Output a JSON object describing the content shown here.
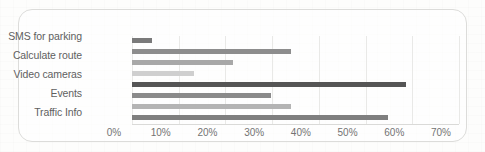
{
  "chart_data": {
    "type": "bar",
    "orientation": "horizontal",
    "title": "",
    "xlabel": "",
    "ylabel": "",
    "grid": true,
    "legend": "none",
    "xlim": [
      0,
      70
    ],
    "categories": [
      "SMS for parking",
      "Calculate route",
      "Video cameras",
      "Events",
      "Traffic Info"
    ],
    "tick_labels": [
      "0%",
      "10%",
      "20%",
      "30%",
      "40%",
      "50%",
      "60%",
      "70%"
    ],
    "tick_values": [
      0,
      10,
      20,
      30,
      40,
      50,
      60,
      70
    ],
    "bars": [
      {
        "label": "SMS for parking",
        "value": 4.3,
        "value_label": "4%",
        "color": "#7a7a7a"
      },
      {
        "label": "Calculate route",
        "value": 34.0,
        "value_label": "34%",
        "color": "#8d8d8d"
      },
      {
        "label": "Calculate route",
        "value": 21.7,
        "value_label": "22%",
        "color": "#a8a8a8"
      },
      {
        "label": "Video cameras",
        "value": 13.3,
        "value_label": "13%",
        "color": "#cfcfcf"
      },
      {
        "label": "Video cameras",
        "value": 58.6,
        "value_label": "59%",
        "color": "#555555"
      },
      {
        "label": "Events",
        "value": 29.8,
        "value_label": "30%",
        "color": "#8a8a8a"
      },
      {
        "label": "Events",
        "value": 34.0,
        "value_label": "34%",
        "color": "#b4b4b4"
      },
      {
        "label": "Traffic Info",
        "value": 54.7,
        "value_label": "55%",
        "color": "#7f7f7f"
      }
    ]
  },
  "colors": {
    "frame_border": "#dcdcda",
    "gridline": "#e9e9e7",
    "axis": "#dadad8",
    "label_text": "#4a4a4a",
    "tick_text": "#5a5a5a",
    "page_background": "#fdfdfc"
  }
}
